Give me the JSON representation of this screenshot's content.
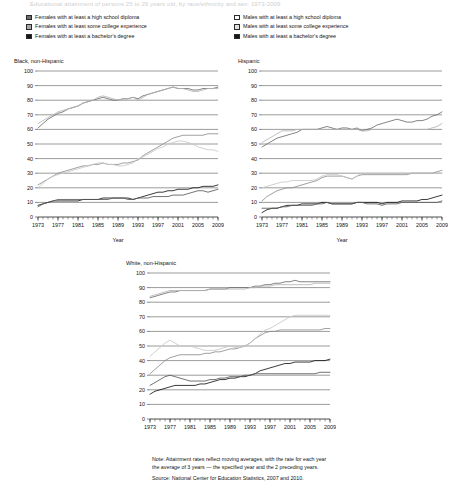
{
  "page": {
    "clipped_header": "Educational attainment of persons 25 to 29 years old, by race/ethnicity and sex: 1973-2009"
  },
  "legend_females": {
    "title": "Females",
    "items": [
      {
        "label": "Females with at least a high school diploma",
        "swatch": "dark-gray",
        "color": "#6f6f6f"
      },
      {
        "label": "Females with at least some college experience",
        "swatch": "mid-gray",
        "color": "#a9a9a9"
      },
      {
        "label": "Females with at least a bachelor's degree",
        "swatch": "black",
        "color": "#181818"
      }
    ]
  },
  "legend_males": {
    "title": "Males",
    "items": [
      {
        "label": "Males with at least a high school diploma",
        "swatch": "white",
        "color": "#fdfdfd"
      },
      {
        "label": "Males with at least some college experience",
        "swatch": "light-gray",
        "color": "#e2e2e2"
      },
      {
        "label": "Males with at least a bachelor's degree",
        "swatch": "black",
        "color": "#181818"
      }
    ]
  },
  "axis": {
    "xlabel": "Year",
    "yticks": [
      "100",
      "90",
      "80",
      "70",
      "60",
      "50",
      "40",
      "30",
      "20",
      "10",
      "0"
    ],
    "xticks": [
      "1973",
      "1977",
      "1981",
      "1985",
      "1989",
      "1993",
      "1997",
      "2001",
      "2005",
      "2009"
    ]
  },
  "notes": {
    "line1": "Note: Attainment rates reflect moving averages, with the rate for each year",
    "line2": "the average of 3 years — the specified year and the 2 preceding years.",
    "source": "Source: National Center for Education Statistics, 2007 and 2010."
  },
  "chart_data": [
    {
      "type": "line",
      "title": "Black, non-Hispanic",
      "xlabel": "Year",
      "ylabel": "",
      "xlim": [
        1973,
        2009
      ],
      "ylim": [
        0,
        100
      ],
      "grid": true,
      "legend_position": "external-top",
      "x": [
        1973,
        1974,
        1975,
        1976,
        1977,
        1978,
        1979,
        1980,
        1981,
        1982,
        1983,
        1984,
        1985,
        1986,
        1987,
        1988,
        1989,
        1990,
        1991,
        1992,
        1993,
        1994,
        1995,
        1996,
        1997,
        1998,
        1999,
        2000,
        2001,
        2002,
        2003,
        2004,
        2005,
        2006,
        2007,
        2008,
        2009
      ],
      "series": [
        {
          "name": "Females with at least a high school diploma",
          "color": "#6f6f6f",
          "values": [
            61,
            64,
            67,
            69,
            71,
            72,
            74,
            75,
            76,
            78,
            79,
            80,
            81,
            82,
            81,
            80,
            80,
            81,
            81,
            82,
            81,
            83,
            84,
            85,
            86,
            87,
            88,
            89,
            88,
            88,
            88,
            87,
            87,
            88,
            88,
            88,
            89
          ]
        },
        {
          "name": "Males with at least a high school diploma",
          "color": "#b5b5b5",
          "values": [
            64,
            66,
            68,
            70,
            72,
            73,
            74,
            75,
            76,
            78,
            79,
            80,
            82,
            83,
            82,
            81,
            80,
            81,
            81,
            82,
            80,
            82,
            84,
            85,
            86,
            87,
            88,
            89,
            88,
            88,
            87,
            86,
            86,
            87,
            88,
            88,
            88
          ]
        },
        {
          "name": "Females with at least some college experience",
          "color": "#8f8f8f",
          "values": [
            22,
            24,
            26,
            28,
            30,
            31,
            32,
            33,
            34,
            35,
            35,
            36,
            36,
            37,
            36,
            36,
            36,
            37,
            37,
            38,
            39,
            42,
            44,
            46,
            48,
            50,
            52,
            54,
            55,
            56,
            56,
            56,
            56,
            56,
            57,
            57,
            57
          ]
        },
        {
          "name": "Males with at least some college experience",
          "color": "#c7c7c7",
          "values": [
            20,
            23,
            26,
            28,
            29,
            30,
            31,
            32,
            33,
            34,
            35,
            36,
            37,
            37,
            36,
            36,
            35,
            35,
            36,
            37,
            40,
            41,
            43,
            45,
            47,
            48,
            50,
            51,
            52,
            52,
            51,
            50,
            48,
            47,
            46,
            46,
            45
          ]
        },
        {
          "name": "Females with at least a bachelor's degree",
          "color": "#181818",
          "values": [
            8,
            9,
            10,
            11,
            11,
            11,
            11,
            11,
            11,
            12,
            12,
            12,
            12,
            13,
            13,
            13,
            13,
            13,
            13,
            12,
            13,
            14,
            15,
            16,
            17,
            17,
            18,
            18,
            19,
            19,
            19,
            20,
            20,
            21,
            21,
            21,
            22
          ]
        },
        {
          "name": "Males with at least a bachelor's degree",
          "color": "#5a5a5a",
          "values": [
            7,
            9,
            10,
            11,
            12,
            12,
            12,
            12,
            12,
            12,
            12,
            12,
            12,
            12,
            12,
            13,
            13,
            13,
            12,
            12,
            13,
            13,
            13,
            14,
            14,
            14,
            14,
            15,
            15,
            15,
            16,
            17,
            18,
            18,
            17,
            18,
            19
          ]
        }
      ]
    },
    {
      "type": "line",
      "title": "Hispanic",
      "xlabel": "Year",
      "ylabel": "",
      "xlim": [
        1973,
        2009
      ],
      "ylim": [
        0,
        100
      ],
      "grid": true,
      "legend_position": "external-top",
      "x": [
        1973,
        1974,
        1975,
        1976,
        1977,
        1978,
        1979,
        1980,
        1981,
        1982,
        1983,
        1984,
        1985,
        1986,
        1987,
        1988,
        1989,
        1990,
        1991,
        1992,
        1993,
        1994,
        1995,
        1996,
        1997,
        1998,
        1999,
        2000,
        2001,
        2002,
        2003,
        2004,
        2005,
        2006,
        2007,
        2008,
        2009
      ],
      "series": [
        {
          "name": "Females with at least a high school diploma",
          "color": "#6f6f6f",
          "values": [
            48,
            50,
            52,
            54,
            55,
            56,
            57,
            58,
            60,
            60,
            60,
            60,
            61,
            62,
            61,
            60,
            61,
            61,
            60,
            61,
            59,
            60,
            61,
            63,
            64,
            65,
            66,
            67,
            66,
            65,
            65,
            66,
            66,
            67,
            69,
            70,
            72
          ]
        },
        {
          "name": "Males with at least a high school diploma",
          "color": "#b5b5b5",
          "values": [
            51,
            53,
            55,
            57,
            59,
            59,
            59,
            60,
            60,
            60,
            60,
            60,
            60,
            60,
            60,
            60,
            60,
            60,
            60,
            60,
            59,
            59,
            60,
            60,
            60,
            60,
            60,
            60,
            60,
            60,
            60,
            60,
            60,
            60,
            61,
            62,
            64
          ]
        },
        {
          "name": "Females with at least some college experience",
          "color": "#8f8f8f",
          "values": [
            11,
            14,
            16,
            18,
            19,
            20,
            20,
            21,
            22,
            23,
            24,
            25,
            27,
            28,
            28,
            28,
            28,
            27,
            26,
            28,
            29,
            29,
            29,
            29,
            29,
            29,
            29,
            29,
            29,
            29,
            30,
            30,
            30,
            30,
            30,
            31,
            32
          ]
        },
        {
          "name": "Males with at least some college experience",
          "color": "#c7c7c7",
          "values": [
            20,
            21,
            22,
            23,
            24,
            24,
            25,
            25,
            25,
            25,
            25,
            26,
            28,
            29,
            29,
            29,
            28,
            27,
            26,
            28,
            30,
            30,
            30,
            30,
            30,
            30,
            30,
            30,
            30,
            30,
            30,
            30,
            30,
            30,
            30,
            30,
            30
          ]
        },
        {
          "name": "Females with at least a bachelor's degree",
          "color": "#181818",
          "values": [
            3,
            5,
            6,
            6,
            7,
            8,
            8,
            8,
            9,
            9,
            9,
            9,
            10,
            10,
            9,
            9,
            9,
            9,
            9,
            10,
            10,
            10,
            10,
            10,
            9,
            10,
            10,
            10,
            11,
            11,
            11,
            11,
            12,
            12,
            13,
            14,
            15
          ]
        },
        {
          "name": "Males with at least a bachelor's degree",
          "color": "#5a5a5a",
          "values": [
            6,
            6,
            6,
            6,
            7,
            7,
            8,
            8,
            8,
            8,
            8,
            9,
            9,
            10,
            9,
            9,
            9,
            9,
            9,
            10,
            10,
            9,
            9,
            9,
            8,
            9,
            9,
            9,
            10,
            10,
            10,
            10,
            10,
            10,
            10,
            10,
            11
          ]
        }
      ]
    },
    {
      "type": "line",
      "title": "White, non-Hispanic",
      "xlabel": "Year",
      "ylabel": "",
      "xlim": [
        1973,
        2009
      ],
      "ylim": [
        0,
        100
      ],
      "grid": true,
      "legend_position": "external-top",
      "x": [
        1973,
        1974,
        1975,
        1976,
        1977,
        1978,
        1979,
        1980,
        1981,
        1982,
        1983,
        1984,
        1985,
        1986,
        1987,
        1988,
        1989,
        1990,
        1991,
        1992,
        1993,
        1994,
        1995,
        1996,
        1997,
        1998,
        1999,
        2000,
        2001,
        2002,
        2003,
        2004,
        2005,
        2006,
        2007,
        2008,
        2009
      ],
      "series": [
        {
          "name": "Females with at least a high school diploma",
          "color": "#6f6f6f",
          "values": [
            83,
            84,
            85,
            86,
            87,
            87,
            88,
            88,
            88,
            88,
            88,
            88,
            89,
            89,
            89,
            89,
            90,
            90,
            90,
            90,
            90,
            91,
            91,
            92,
            92,
            93,
            93,
            94,
            94,
            95,
            94,
            94,
            94,
            94,
            94,
            94,
            94
          ]
        },
        {
          "name": "Males with at least a high school diploma",
          "color": "#b5b5b5",
          "values": [
            84,
            85,
            86,
            87,
            88,
            88,
            88,
            88,
            88,
            88,
            88,
            88,
            89,
            89,
            89,
            89,
            89,
            89,
            89,
            89,
            90,
            90,
            91,
            91,
            91,
            92,
            92,
            92,
            92,
            92,
            92,
            92,
            92,
            93,
            93,
            93,
            93
          ]
        },
        {
          "name": "Females with at least some college experience",
          "color": "#8f8f8f",
          "values": [
            31,
            34,
            37,
            40,
            42,
            43,
            44,
            44,
            44,
            44,
            44,
            45,
            45,
            46,
            46,
            47,
            48,
            48,
            49,
            50,
            52,
            55,
            57,
            59,
            60,
            60,
            61,
            61,
            61,
            61,
            61,
            61,
            61,
            61,
            61,
            62,
            62
          ]
        },
        {
          "name": "Males with at least some college experience",
          "color": "#c7c7c7",
          "values": [
            43,
            46,
            49,
            52,
            54,
            52,
            50,
            50,
            50,
            49,
            48,
            47,
            47,
            47,
            48,
            49,
            50,
            49,
            49,
            50,
            52,
            55,
            58,
            61,
            62,
            64,
            66,
            68,
            70,
            71,
            71,
            71,
            71,
            71,
            71,
            71,
            71
          ]
        },
        {
          "name": "Females with at least a bachelor's degree",
          "color": "#181818",
          "values": [
            17,
            19,
            20,
            21,
            22,
            23,
            23,
            23,
            23,
            23,
            24,
            24,
            25,
            26,
            27,
            27,
            28,
            28,
            29,
            29,
            30,
            31,
            33,
            34,
            35,
            36,
            37,
            38,
            38,
            39,
            39,
            39,
            39,
            40,
            40,
            40,
            41
          ]
        },
        {
          "name": "Males with at least a bachelor's degree",
          "color": "#5a5a5a",
          "values": [
            23,
            25,
            27,
            29,
            30,
            29,
            28,
            27,
            26,
            26,
            26,
            26,
            27,
            27,
            28,
            28,
            29,
            29,
            29,
            30,
            30,
            31,
            31,
            31,
            31,
            31,
            31,
            31,
            31,
            31,
            31,
            31,
            31,
            31,
            32,
            32,
            32
          ]
        }
      ]
    }
  ]
}
